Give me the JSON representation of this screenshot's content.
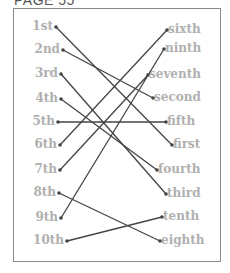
{
  "title": "PAGE 55",
  "left_items": [
    {
      "label": "1st",
      "x": 56,
      "y": 27
    },
    {
      "label": "2nd",
      "x": 63,
      "y": 50
    },
    {
      "label": "3rd",
      "x": 61,
      "y": 74
    },
    {
      "label": "4th",
      "x": 61,
      "y": 99
    },
    {
      "label": "5th",
      "x": 58,
      "y": 122
    },
    {
      "label": "6th",
      "x": 60,
      "y": 145
    },
    {
      "label": "7th",
      "x": 60,
      "y": 170
    },
    {
      "label": "8th",
      "x": 59,
      "y": 193
    },
    {
      "label": "9th",
      "x": 61,
      "y": 218
    },
    {
      "label": "10th",
      "x": 67,
      "y": 241
    }
  ],
  "right_items": [
    {
      "label": "sixth",
      "x": 167,
      "y": 30
    },
    {
      "label": "ninth",
      "x": 164,
      "y": 49
    },
    {
      "label": "seventh",
      "x": 148,
      "y": 75
    },
    {
      "label": "second",
      "x": 153,
      "y": 98
    },
    {
      "label": "fifth",
      "x": 166,
      "y": 122
    },
    {
      "label": "first",
      "x": 172,
      "y": 145
    },
    {
      "label": "fourth",
      "x": 157,
      "y": 170
    },
    {
      "label": "third",
      "x": 166,
      "y": 194
    },
    {
      "label": "tenth",
      "x": 162,
      "y": 217
    },
    {
      "label": "eighth",
      "x": 160,
      "y": 241
    }
  ],
  "connections": [
    [
      "1st",
      "first"
    ],
    [
      "2nd",
      "second"
    ],
    [
      "3rd",
      "third"
    ],
    [
      "4th",
      "fourth"
    ],
    [
      "5th",
      "fifth"
    ],
    [
      "6th",
      "sixth"
    ],
    [
      "7th",
      "seventh"
    ],
    [
      "8th",
      "eighth"
    ],
    [
      "9th",
      "ninth"
    ],
    [
      "10th",
      "tenth"
    ]
  ],
  "colors": {
    "label": "#b0b0b0",
    "line": "#444444",
    "border": "#8a8a8a"
  }
}
